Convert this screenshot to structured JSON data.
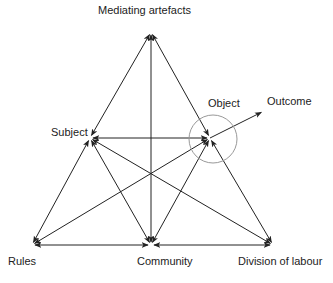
{
  "diagram": {
    "nodes": {
      "mediating_artefacts": {
        "label": "Mediating artefacts",
        "x": 151,
        "y": 32
      },
      "subject": {
        "label": "Subject",
        "x": 90,
        "y": 138
      },
      "object": {
        "label": "Object",
        "x": 210,
        "y": 138
      },
      "outcome": {
        "label": "Outcome",
        "x": 264,
        "y": 111
      },
      "rules": {
        "label": "Rules",
        "x": 32,
        "y": 245
      },
      "community": {
        "label": "Community",
        "x": 151,
        "y": 245
      },
      "division_of_labour": {
        "label": "Division of labour",
        "x": 273,
        "y": 245
      }
    },
    "edges": [
      {
        "from": "mediating_artefacts",
        "to": "subject",
        "type": "double-arrow"
      },
      {
        "from": "mediating_artefacts",
        "to": "object",
        "type": "double-arrow"
      },
      {
        "from": "mediating_artefacts",
        "to": "community",
        "type": "double-arrow"
      },
      {
        "from": "subject",
        "to": "object",
        "type": "double-arrow"
      },
      {
        "from": "subject",
        "to": "rules",
        "type": "double-arrow"
      },
      {
        "from": "subject",
        "to": "community",
        "type": "double-arrow"
      },
      {
        "from": "subject",
        "to": "division_of_labour",
        "type": "double-arrow"
      },
      {
        "from": "object",
        "to": "rules",
        "type": "double-arrow"
      },
      {
        "from": "object",
        "to": "community",
        "type": "double-arrow"
      },
      {
        "from": "object",
        "to": "division_of_labour",
        "type": "double-arrow"
      },
      {
        "from": "rules",
        "to": "community",
        "type": "double-arrow"
      },
      {
        "from": "community",
        "to": "division_of_labour",
        "type": "double-arrow"
      },
      {
        "from": "object",
        "to": "outcome",
        "type": "arrow"
      }
    ],
    "object_circle": {
      "cx": 213,
      "cy": 139,
      "r": 24,
      "color": "#999999"
    },
    "line_color": "#222222"
  }
}
